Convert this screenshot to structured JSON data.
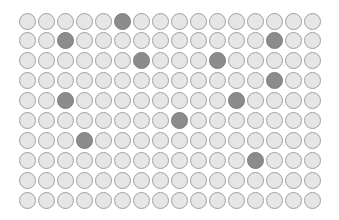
{
  "grid": {
    "rows": 10,
    "cols": 16,
    "colors": {
      "empty_fill": "#e6e6e6",
      "empty_border": "#a0a0a0",
      "filled_fill": "#8c8c8c",
      "filled_border": "#7c7c7c"
    },
    "filled_cells": [
      [
        0,
        5
      ],
      [
        1,
        2
      ],
      [
        1,
        13
      ],
      [
        2,
        6
      ],
      [
        2,
        10
      ],
      [
        3,
        13
      ],
      [
        4,
        2
      ],
      [
        4,
        11
      ],
      [
        5,
        8
      ],
      [
        6,
        3
      ],
      [
        7,
        12
      ]
    ],
    "filled_count": 11,
    "total_count": 160
  }
}
